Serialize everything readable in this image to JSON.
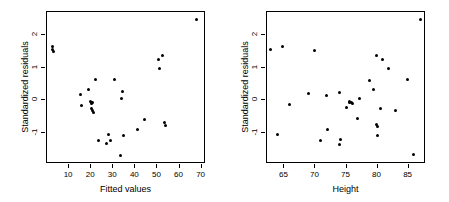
{
  "figure": {
    "width": 449,
    "height": 202,
    "background": "#ffffff",
    "foreground": "#000000",
    "panel_count": 2
  },
  "chart_data": [
    {
      "type": "scatter",
      "panel": "left",
      "title": "",
      "xlabel": "Fitted values",
      "ylabel": "Standardized residuals",
      "xlim": [
        0,
        72
      ],
      "ylim": [
        -1.95,
        2.7
      ],
      "xticks": [
        10,
        20,
        30,
        40,
        50,
        60,
        70
      ],
      "xticklabels": [
        "10",
        "20",
        "30",
        "40",
        "50",
        "60",
        "70"
      ],
      "yticks": [
        2,
        1,
        0,
        -1
      ],
      "yticklabels": [
        "2",
        "1",
        "0",
        "-1"
      ],
      "grid": false,
      "legend": null,
      "marker": "filled-circle",
      "marker_color": "#000000",
      "points": [
        [
          3.0,
          1.62
        ],
        [
          3.1,
          1.52
        ],
        [
          3.2,
          1.45
        ],
        [
          15.8,
          0.14
        ],
        [
          16.0,
          -0.18
        ],
        [
          19.2,
          0.31
        ],
        [
          20.0,
          -0.06
        ],
        [
          20.4,
          -0.1
        ],
        [
          20.6,
          -0.13
        ],
        [
          20.8,
          -0.28
        ],
        [
          21.0,
          -0.09
        ],
        [
          21.2,
          -0.34
        ],
        [
          21.4,
          -0.4
        ],
        [
          22.2,
          0.6
        ],
        [
          23.8,
          -1.25
        ],
        [
          27.6,
          -1.35
        ],
        [
          28.2,
          -1.09
        ],
        [
          29.0,
          -1.27
        ],
        [
          30.8,
          0.61
        ],
        [
          33.8,
          -1.72
        ],
        [
          34.0,
          0.02
        ],
        [
          34.6,
          0.23
        ],
        [
          35.2,
          -1.12
        ],
        [
          41.6,
          -0.94
        ],
        [
          44.8,
          -0.63
        ],
        [
          50.8,
          1.21
        ],
        [
          51.4,
          0.94
        ],
        [
          52.8,
          1.33
        ],
        [
          53.8,
          -0.7
        ],
        [
          54.0,
          -0.79
        ],
        [
          68.2,
          2.45
        ]
      ]
    },
    {
      "type": "scatter",
      "panel": "right",
      "title": "",
      "xlabel": "Height",
      "ylabel": "Standardized residuals",
      "xlim": [
        62.2,
        87.8
      ],
      "ylim": [
        -1.95,
        2.7
      ],
      "xticks": [
        65,
        70,
        75,
        80,
        85
      ],
      "xticklabels": [
        "65",
        "70",
        "75",
        "80",
        "85"
      ],
      "yticks": [
        2,
        1,
        0,
        -1
      ],
      "yticklabels": [
        "2",
        "1",
        "0",
        "-1"
      ],
      "grid": false,
      "legend": null,
      "marker": "filled-circle",
      "marker_color": "#000000",
      "points": [
        [
          63.0,
          1.52
        ],
        [
          64.0,
          -1.08
        ],
        [
          64.9,
          1.6
        ],
        [
          66.0,
          -0.16
        ],
        [
          69.0,
          0.18
        ],
        [
          70.0,
          1.5
        ],
        [
          71.0,
          -1.26
        ],
        [
          72.0,
          0.13
        ],
        [
          72.1,
          -0.94
        ],
        [
          74.0,
          0.21
        ],
        [
          74.0,
          -1.38
        ],
        [
          74.2,
          -1.23
        ],
        [
          75.2,
          -0.25
        ],
        [
          75.6,
          -0.06
        ],
        [
          75.7,
          -0.09
        ],
        [
          75.9,
          -0.1
        ],
        [
          76.1,
          -0.12
        ],
        [
          77.0,
          -0.6
        ],
        [
          77.2,
          0.03
        ],
        [
          78.9,
          0.58
        ],
        [
          79.5,
          0.3
        ],
        [
          80.0,
          1.33
        ],
        [
          80.0,
          -0.76
        ],
        [
          80.1,
          -0.82
        ],
        [
          80.1,
          -1.1
        ],
        [
          80.6,
          -0.28
        ],
        [
          81.0,
          1.21
        ],
        [
          82.0,
          0.94
        ],
        [
          83.0,
          -0.33
        ],
        [
          85.0,
          0.6
        ],
        [
          86.0,
          -1.7
        ],
        [
          87.0,
          2.45
        ]
      ]
    }
  ]
}
